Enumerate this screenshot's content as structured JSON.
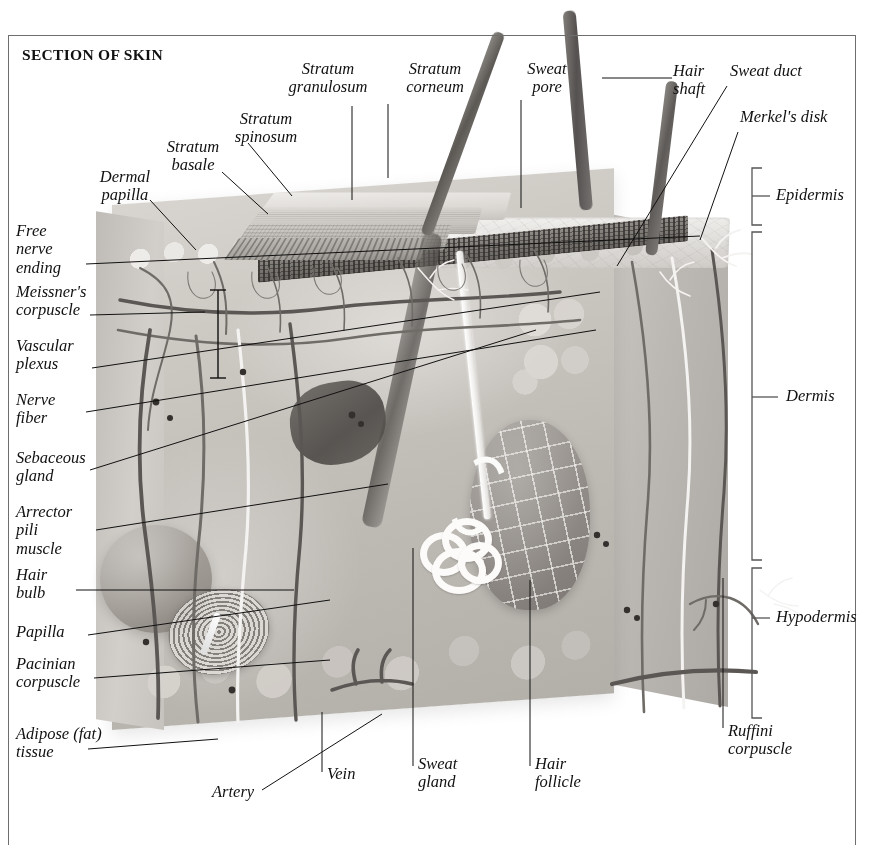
{
  "plate": {
    "title": "SECTION OF SKIN"
  },
  "labels": {
    "stratum_granulosum": "Stratum\ngranulosum",
    "stratum_corneum": "Stratum\ncorneum",
    "sweat_pore": "Sweat\npore",
    "hair_shaft": "Hair\nshaft",
    "sweat_duct": "Sweat duct",
    "merkels_disk": "Merkel's disk",
    "stratum_spinosum": "Stratum\nspinosum",
    "stratum_basale": "Stratum\nbasale",
    "dermal_papilla": "Dermal\npapilla",
    "free_nerve_ending": "Free\nnerve\nending",
    "meissners_corpuscle": "Meissner's\ncorpuscle",
    "vascular_plexus": "Vascular\nplexus",
    "nerve_fiber": "Nerve\nfiber",
    "sebaceous_gland": "Sebaceous\ngland",
    "arrector_pili_muscle": "Arrector\npili\nmuscle",
    "hair_bulb": "Hair\nbulb",
    "papilla": "Papilla",
    "pacinian_corpuscle": "Pacinian\ncorpuscle",
    "adipose_tissue": "Adipose (fat)\ntissue",
    "artery": "Artery",
    "vein": "Vein",
    "sweat_gland": "Sweat\ngland",
    "hair_follicle": "Hair\nfollicle",
    "ruffini_corpuscle": "Ruffini\ncorpuscle",
    "epidermis": "Epidermis",
    "dermis": "Dermis",
    "hypodermis": "Hypodermis"
  },
  "layers": [
    {
      "name": "Epidermis",
      "bracket_top": 168,
      "bracket_bottom": 225
    },
    {
      "name": "Dermis",
      "bracket_top": 232,
      "bracket_bottom": 560
    },
    {
      "name": "Hypodermis",
      "bracket_top": 568,
      "bracket_bottom": 718
    }
  ],
  "colors": {
    "ink": "#111111",
    "frame": "#6e6e6e",
    "bracket": "#555555",
    "background": "#ffffff",
    "tissue_light": "#d8d4cf",
    "tissue_mid": "#bdb9b3",
    "tissue_dark": "#8e8984",
    "nerve_white": "#f4f3f1",
    "vessel_dark": "#5b5754"
  }
}
